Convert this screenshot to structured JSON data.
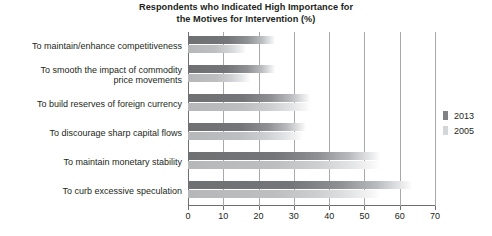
{
  "chart_data": {
    "type": "bar",
    "orientation": "horizontal",
    "title": "Respondents who Indicated High Importance for the Motives for Intervention (%)",
    "title_lines": [
      "Respondents who Indicated High Importance for",
      "the Motives for Intervention (%)"
    ],
    "xlabel": "",
    "ylabel": "",
    "xlim": [
      0,
      70
    ],
    "xticks": [
      0,
      10,
      20,
      30,
      40,
      50,
      60,
      70
    ],
    "xtick_labels": [
      "0",
      "10",
      "20",
      "30",
      "40",
      "50",
      "60",
      "70"
    ],
    "grid": "vertical",
    "legend_position": "right",
    "categories": [
      "To maintain/enhance competitiveness",
      "To smooth the impact of commodity price movements",
      "To build reserves of foreign currency",
      "To discourage sharp capital flows",
      "To maintain monetary stability",
      "To curb excessive speculation"
    ],
    "category_lines": [
      [
        "To maintain/enhance competitiveness"
      ],
      [
        "To smooth the impact of commodity",
        "price movements"
      ],
      [
        "To build reserves of foreign currency"
      ],
      [
        "To discourage sharp capital flows"
      ],
      [
        "To maintain monetary stability"
      ],
      [
        "To curb excessive speculation"
      ]
    ],
    "series": [
      {
        "name": "2013",
        "color": "#808285",
        "values": [
          20,
          20,
          30,
          29,
          50,
          59
        ]
      },
      {
        "name": "2005",
        "color": "#d4d5d7",
        "values": [
          12,
          13,
          30,
          28,
          50,
          50
        ]
      }
    ]
  },
  "legend": {
    "items": [
      {
        "label": "2013"
      },
      {
        "label": "2005"
      }
    ]
  }
}
